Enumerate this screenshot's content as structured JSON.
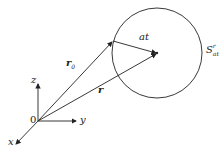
{
  "diagram": {
    "labels": {
      "z": "z",
      "y": "y",
      "x": "x",
      "origin": "0",
      "r0": "r",
      "r0_sub": "0",
      "r": "r",
      "at": "at",
      "sphere": "S",
      "sphere_sup": "r",
      "sphere_sub": "at"
    },
    "colors": {
      "stroke": "#222222",
      "background": "#ffffff"
    }
  }
}
